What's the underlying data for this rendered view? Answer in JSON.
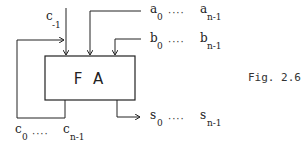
{
  "diagram": {
    "block": {
      "label": "F A"
    },
    "inputs": {
      "carry_in": {
        "base": "c",
        "sub": "-1"
      },
      "a": {
        "first_base": "a",
        "first_sub": "0",
        "dots": "····",
        "last_base": "a",
        "last_sub": "n-1"
      },
      "b": {
        "first_base": "b",
        "first_sub": "0",
        "dots": "····",
        "last_base": "b",
        "last_sub": "n-1"
      }
    },
    "outputs": {
      "carry": {
        "first_base": "c",
        "first_sub": "0",
        "dots": "····",
        "last_base": "c",
        "last_sub": "n-1"
      },
      "sum": {
        "first_base": "s",
        "first_sub": "0",
        "dots": "····",
        "last_base": "s",
        "last_sub": "n-1"
      }
    },
    "caption": "Fig. 2.6",
    "colors": {
      "line": "#222222",
      "background": "#ffffff"
    }
  }
}
